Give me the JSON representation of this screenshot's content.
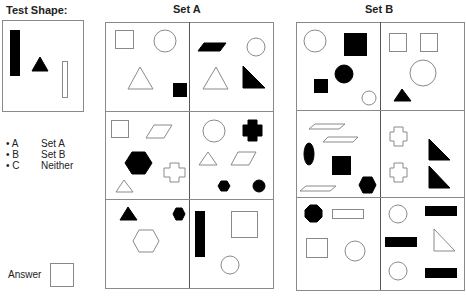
{
  "test_shape": {
    "title": "Test Shape:",
    "shapes": [
      {
        "type": "rect",
        "x": 10,
        "y": 30,
        "w": 9,
        "h": 45,
        "fill": "#000"
      },
      {
        "type": "poly",
        "points": "32,71 48,71 40,57",
        "fill": "#000"
      },
      {
        "type": "rect",
        "x": 62,
        "y": 61,
        "w": 5,
        "h": 36,
        "fill": "none"
      }
    ]
  },
  "legend": {
    "items": [
      {
        "key": "• A",
        "label": "Set A"
      },
      {
        "key": "• B",
        "label": "Set B"
      },
      {
        "key": "• C",
        "label": "Neither"
      }
    ]
  },
  "answer": {
    "label": "Answer"
  },
  "set_a": {
    "title": "Set A",
    "cells": [
      [
        {
          "type": "rect",
          "x": 115,
          "y": 30,
          "w": 18,
          "h": 18,
          "fill": "none"
        },
        {
          "type": "circle",
          "cx": 165,
          "cy": 41,
          "r": 11,
          "fill": "none"
        },
        {
          "type": "poly",
          "points": "128,89 153,89 140,67",
          "fill": "none"
        },
        {
          "type": "rect",
          "x": 173,
          "y": 83,
          "w": 13,
          "h": 13,
          "fill": "#000"
        }
      ],
      [
        {
          "type": "poly",
          "points": "198,51 220,51 226,43 204,43",
          "fill": "#000"
        },
        {
          "type": "circle",
          "cx": 256,
          "cy": 47,
          "r": 9,
          "fill": "none"
        },
        {
          "type": "poly",
          "points": "203,89 228,89 216,67",
          "fill": "none"
        },
        {
          "type": "poly",
          "points": "243,66 243,88 265,88",
          "fill": "#000"
        }
      ],
      [
        {
          "type": "rect",
          "x": 111,
          "y": 120,
          "w": 17,
          "h": 17,
          "fill": "none"
        },
        {
          "type": "poly",
          "points": "146,138 164,138 172,125 154,125",
          "fill": "none"
        },
        {
          "type": "poly",
          "points": "125,163 132,152 145,152 152,163 145,174 132,174",
          "fill": "#000"
        },
        {
          "type": "poly",
          "points": "170,163 170,168 164,168 164,177 170,177 170,182 179,182 179,177 185,177 185,168 179,168 179,163",
          "fill": "none"
        },
        {
          "type": "poly",
          "points": "116,192 133,192 124,180",
          "fill": "none"
        }
      ],
      [
        {
          "type": "circle",
          "cx": 214,
          "cy": 131,
          "r": 11,
          "fill": "none"
        },
        {
          "type": "poly",
          "points": "248,120 248,125 243,125 243,136 248,136 248,141 257,141 257,136 262,136 262,125 257,125 257,120",
          "fill": "#000"
        },
        {
          "type": "poly",
          "points": "199,165 217,165 208,152",
          "fill": "none"
        },
        {
          "type": "poly",
          "points": "231,165 249,165 256,152 238,152",
          "fill": "none"
        },
        {
          "type": "poly",
          "points": "218,186 221,181 227,181 230,186 227,191 221,191",
          "fill": "#000"
        },
        {
          "type": "circle",
          "cx": 259,
          "cy": 186,
          "r": 6,
          "fill": "#000"
        }
      ],
      [
        {
          "type": "poly",
          "points": "120,220 137,220 128,207",
          "fill": "#000"
        },
        {
          "type": "poly",
          "points": "173,214 176,208 182,208 185,214 182,220 176,220",
          "fill": "#000"
        },
        {
          "type": "poly",
          "points": "133,241 139,230 153,230 159,241 153,252 139,252",
          "fill": "none"
        }
      ],
      [
        {
          "type": "rect",
          "x": 195,
          "y": 211,
          "w": 9,
          "h": 45,
          "fill": "#000"
        },
        {
          "type": "rect",
          "x": 231,
          "y": 211,
          "w": 26,
          "h": 26,
          "fill": "none"
        },
        {
          "type": "circle",
          "cx": 230,
          "cy": 265,
          "r": 9,
          "fill": "none"
        }
      ]
    ]
  },
  "set_b": {
    "title": "Set B",
    "cells": [
      [
        {
          "type": "circle",
          "cx": 315,
          "cy": 41,
          "r": 11,
          "fill": "none"
        },
        {
          "type": "rect",
          "x": 344,
          "y": 33,
          "w": 22,
          "h": 22,
          "fill": "#000"
        },
        {
          "type": "circle",
          "cx": 344,
          "cy": 74,
          "r": 9,
          "fill": "#000"
        },
        {
          "type": "rect",
          "x": 314,
          "y": 79,
          "w": 13,
          "h": 13,
          "fill": "#000"
        },
        {
          "type": "circle",
          "cx": 369,
          "cy": 98,
          "r": 7,
          "fill": "none"
        }
      ],
      [
        {
          "type": "rect",
          "x": 389,
          "y": 33,
          "w": 17,
          "h": 18,
          "fill": "none"
        },
        {
          "type": "rect",
          "x": 420,
          "y": 33,
          "w": 17,
          "h": 18,
          "fill": "none"
        },
        {
          "type": "circle",
          "cx": 423,
          "cy": 73,
          "r": 13,
          "fill": "none"
        },
        {
          "type": "poly",
          "points": "394,101 411,101 402,89",
          "fill": "#000"
        }
      ],
      [
        {
          "type": "poly",
          "points": "309,129 339,129 345,124 315,124",
          "fill": "none"
        },
        {
          "type": "poly",
          "points": "323,142 353,142 358,137 328,137",
          "fill": "none"
        },
        {
          "type": "ellipse",
          "cx": 309,
          "cy": 154,
          "rx": 5,
          "ry": 11,
          "fill": "#000"
        },
        {
          "type": "rect",
          "x": 332,
          "y": 156,
          "w": 18,
          "h": 18,
          "fill": "#000"
        },
        {
          "type": "poly",
          "points": "359,185 363,177 372,177 376,185 372,193 363,193",
          "fill": "#000"
        },
        {
          "type": "poly",
          "points": "300,191 330,191 336,186 306,186",
          "fill": "none"
        }
      ],
      [
        {
          "type": "poly",
          "points": "394,127 394,132 390,132 390,141 394,141 394,146 403,146 403,141 407,141 407,132 403,132 403,127",
          "fill": "none"
        },
        {
          "type": "poly",
          "points": "394,163 394,168 390,168 390,177 394,177 394,182 403,182 403,177 407,177 407,168 403,168 403,163",
          "fill": "none"
        },
        {
          "type": "poly",
          "points": "429,139 429,160 450,160",
          "fill": "#000"
        },
        {
          "type": "poly",
          "points": "429,166 429,188 450,188",
          "fill": "#000"
        }
      ],
      [
        {
          "type": "poly",
          "points": "305,210 310,205 317,205 322,210 322,217 317,222 310,222 305,217",
          "fill": "#000"
        },
        {
          "type": "rect",
          "x": 332,
          "y": 209,
          "w": 31,
          "h": 9,
          "fill": "none"
        },
        {
          "type": "rect",
          "x": 306,
          "y": 238,
          "w": 21,
          "h": 19,
          "fill": "none"
        },
        {
          "type": "circle",
          "cx": 355,
          "cy": 251,
          "r": 10,
          "fill": "none"
        }
      ],
      [
        {
          "type": "circle",
          "cx": 398,
          "cy": 214,
          "r": 9,
          "fill": "none"
        },
        {
          "type": "rect",
          "x": 425,
          "y": 206,
          "w": 31,
          "h": 9,
          "fill": "#000"
        },
        {
          "type": "rect",
          "x": 385,
          "y": 237,
          "w": 31,
          "h": 9,
          "fill": "#000"
        },
        {
          "type": "poly",
          "points": "434,229 434,251 455,251",
          "fill": "none"
        },
        {
          "type": "circle",
          "cx": 398,
          "cy": 271,
          "r": 9,
          "fill": "none"
        },
        {
          "type": "rect",
          "x": 425,
          "y": 268,
          "w": 31,
          "h": 9,
          "fill": "#000"
        }
      ]
    ]
  },
  "colors": {
    "stroke": "#8a8a8a",
    "fill_dark": "#000000",
    "text": "#222222"
  }
}
